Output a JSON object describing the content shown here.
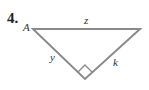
{
  "problem": {
    "number": "4.",
    "vertex_label": "A",
    "sides": {
      "hypotenuse": "z",
      "left_leg": "y",
      "right_leg": "k"
    },
    "right_angle": true,
    "stroke_color": "#8a8a8a"
  }
}
